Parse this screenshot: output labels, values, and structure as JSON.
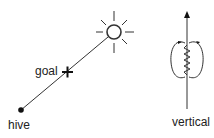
{
  "diagram": {
    "labels": {
      "goal": "goal",
      "hive": "hive",
      "vertical": "vertical"
    },
    "elements": [
      {
        "id": "sun",
        "icon": "sun-icon"
      },
      {
        "id": "goal-marker",
        "icon": "cross-icon"
      },
      {
        "id": "hive-marker",
        "icon": "dot-icon"
      },
      {
        "id": "flight-path",
        "type": "line",
        "from": "hive",
        "to": "sun"
      },
      {
        "id": "vertical-axis",
        "type": "arrow",
        "direction": "up"
      },
      {
        "id": "waggle-dance",
        "icon": "figure-eight-loops-icon"
      }
    ],
    "colors": {
      "stroke": "#222222",
      "background": "#ffffff"
    }
  }
}
